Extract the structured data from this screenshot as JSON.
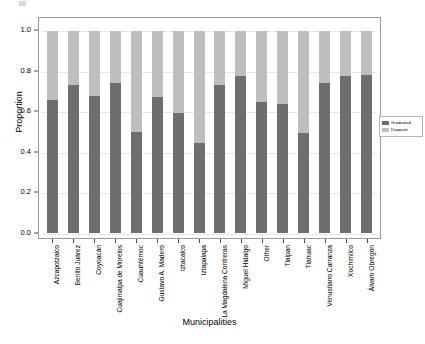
{
  "chart_data": {
    "type": "bar",
    "subtype": "stacked-bar-proportional",
    "title": "",
    "xlabel": "Municipalities",
    "ylabel": "Proportion",
    "ylim": [
      0.0,
      1.0
    ],
    "ytick_labels": [
      "0.0",
      "0.2",
      "0.4",
      "0.6",
      "0.8",
      "1.0"
    ],
    "ytick_values": [
      0.0,
      0.2,
      0.4,
      0.6,
      0.8,
      1.0
    ],
    "grid": true,
    "grid_axis": "y",
    "legend_position": "right",
    "stacked_total": 1.0,
    "categories": [
      "Azcapotzalco",
      "Benito Juárez",
      "Coyoacán",
      "Cuajimalpa de Morelos",
      "Cuauhtémoc",
      "Gustavo A. Madero",
      "Iztacalco",
      "Iztapalapa",
      "La Magdalena Contreras",
      "Miguel Hidalgo",
      "Other",
      "Tlalpan",
      "Tláhuac",
      "Venustiano Carranza",
      "Xochimilco",
      "Álvaro Obregón"
    ],
    "series": [
      {
        "name": "Graduated",
        "color": "#6e6e6e",
        "stack_position": "bottom",
        "values": [
          0.66,
          0.735,
          0.68,
          0.745,
          0.5,
          0.675,
          0.595,
          0.445,
          0.735,
          0.775,
          0.65,
          0.64,
          0.495,
          0.745,
          0.775,
          0.78
        ]
      },
      {
        "name": "Dropouts",
        "color": "#bebebe",
        "stack_position": "top",
        "values": [
          0.34,
          0.265,
          0.32,
          0.255,
          0.5,
          0.325,
          0.405,
          0.555,
          0.265,
          0.225,
          0.35,
          0.36,
          0.505,
          0.255,
          0.225,
          0.22
        ]
      }
    ]
  },
  "legend": {
    "entries": [
      {
        "label": "Graduated",
        "color": "#6e6e6e"
      },
      {
        "label": "Dropouts",
        "color": "#bebebe"
      }
    ]
  },
  "colors": {
    "graduated": "#6e6e6e",
    "dropouts": "#bebebe",
    "grid": "#e8e8e8",
    "frame": "#9a9a9a",
    "background": "#ffffff"
  }
}
